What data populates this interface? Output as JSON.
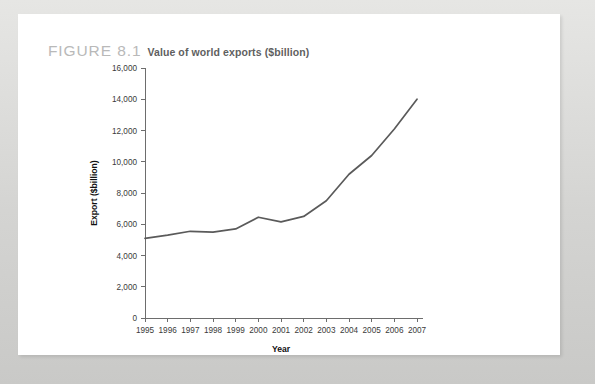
{
  "figure": {
    "label": "FIGURE 8.1",
    "title": "Value of world exports ($billion)"
  },
  "colors": {
    "page_background": "#d8d8d6",
    "card_background": "#ffffff",
    "line_color": "#5a5a5a",
    "axis_color": "#6d6d6d",
    "figure_label_color": "#b9b9b9",
    "figure_title_color": "#5f5f5f"
  },
  "chart_data": {
    "type": "line",
    "title": "Value of world exports ($billion)",
    "xlabel": "Year",
    "ylabel": "Export ($billion)",
    "categories": [
      "1995",
      "1996",
      "1997",
      "1998",
      "1999",
      "2000",
      "2001",
      "2002",
      "2003",
      "2004",
      "2005",
      "2006",
      "2007"
    ],
    "x": [
      1995,
      1996,
      1997,
      1998,
      1999,
      2000,
      2001,
      2002,
      2003,
      2004,
      2005,
      2006,
      2007
    ],
    "values": [
      5100,
      5300,
      5550,
      5500,
      5700,
      6450,
      6150,
      6500,
      7500,
      9200,
      10400,
      12100,
      14000
    ],
    "series": [
      {
        "name": "World exports",
        "values": [
          5100,
          5300,
          5550,
          5500,
          5700,
          6450,
          6150,
          6500,
          7500,
          9200,
          10400,
          12100,
          14000
        ]
      }
    ],
    "ylim": [
      0,
      16000
    ],
    "ytick_values": [
      0,
      2000,
      4000,
      6000,
      8000,
      10000,
      12000,
      14000,
      16000
    ],
    "ytick_labels": [
      "0",
      "2,000",
      "4,000",
      "6,000",
      "8,000",
      "10,000",
      "12,000",
      "14,000",
      "16,000"
    ],
    "xtick_labels": [
      "1995",
      "1996",
      "1997",
      "1998",
      "1999",
      "2000",
      "2001",
      "2002",
      "2003",
      "2004",
      "2005",
      "2006",
      "2007"
    ],
    "grid": false,
    "legend": false,
    "legend_position": "none"
  }
}
